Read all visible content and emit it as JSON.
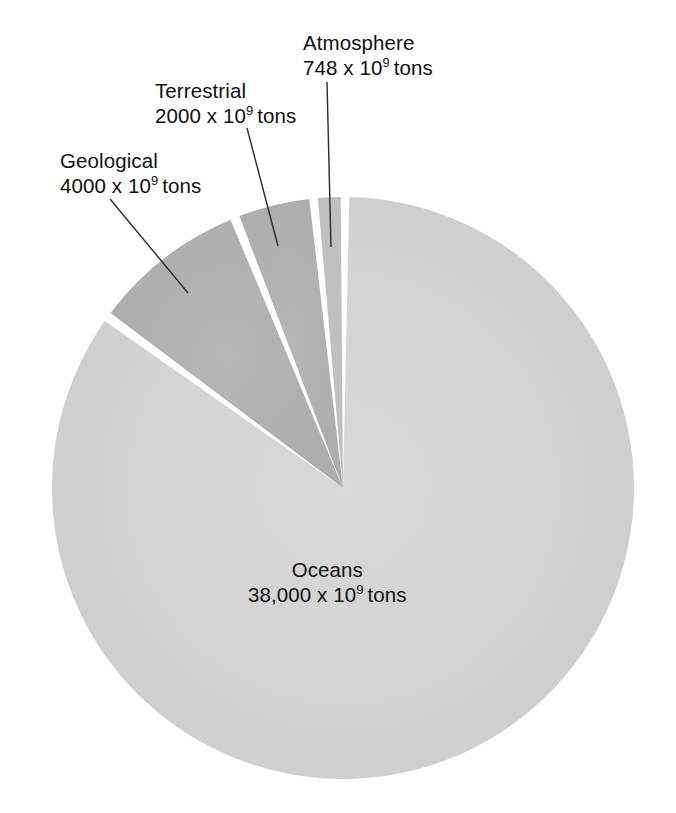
{
  "chart_data": {
    "type": "pie",
    "title": "",
    "subtitle": "",
    "xlabel": "",
    "ylabel": "",
    "unit": "x 10^9 tons",
    "legend_position": "none",
    "grid": false,
    "categories": [
      "Geological",
      "Terrestrial",
      "Atmosphere",
      "Oceans"
    ],
    "values": [
      4000,
      2000,
      748,
      38000
    ],
    "value_labels": [
      "4000 x 10⁹ tons",
      "2000 x 10⁹ tons",
      "748 x 10⁹ tons",
      "38,000 x 10⁹ tons"
    ],
    "percentages": [
      8.94,
      4.47,
      1.67,
      84.92
    ],
    "total": 44748,
    "slice_colors": [
      "#b3b3b3",
      "#b3b3b3",
      "#bdbdbd",
      "#d5d5d5"
    ],
    "separator_color": "#ffffff"
  },
  "slices": {
    "geological": {
      "name": "Geological",
      "value_label": "4000 x 10",
      "exponent": "9",
      "tons": "tons",
      "color": "#b3b3b3",
      "start_angle": 306.0,
      "end_angle": 338.2
    },
    "terrestrial": {
      "name": "Terrestrial",
      "value_label": "2000 x 10",
      "exponent": "9",
      "tons": "tons",
      "color": "#b3b3b3",
      "start_angle": 338.2,
      "end_angle": 354.3
    },
    "atmosphere": {
      "name": "Atmosphere",
      "value_label": "748 x 10",
      "exponent": "9",
      "tons": "tons",
      "color": "#bdbdbd",
      "start_angle": 354.3,
      "end_angle": 360.3
    },
    "oceans": {
      "name": "Oceans",
      "value_label": "38,000 x 10",
      "exponent": "9",
      "tons": "tons",
      "color": "#d5d5d5",
      "start_angle": 0.3,
      "end_angle": 306.0
    }
  },
  "geometry": {
    "center_x": 343,
    "center_y": 488,
    "radius": 291
  },
  "leader_lines": {
    "geological": "from label to geological slice",
    "terrestrial": "from label to terrestrial slice",
    "atmosphere": "from label to atmosphere slice"
  }
}
